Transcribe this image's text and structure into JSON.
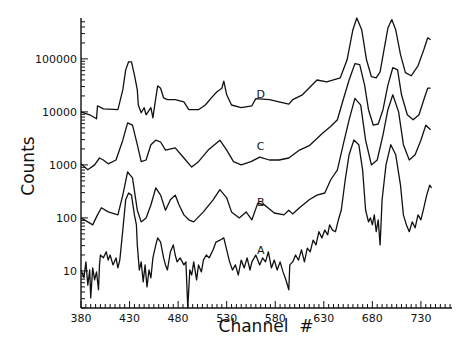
{
  "chart_data": {
    "type": "line",
    "title": "",
    "xlabel": "Channel  #",
    "ylabel": "Counts",
    "xscale": "linear",
    "yscale": "log",
    "xlim": [
      380,
      762
    ],
    "ylim": [
      2,
      590000
    ],
    "grid": false,
    "legend": "none",
    "x_ticks": [
      380,
      430,
      480,
      530,
      580,
      630,
      680,
      730
    ],
    "x_tick_labels": [
      "380",
      "430",
      "480",
      "530",
      "580",
      "630",
      "680",
      "730"
    ],
    "y_ticks": [
      10,
      100,
      1000,
      10000,
      100000
    ],
    "y_tick_labels": [
      "10",
      "100",
      "1000",
      "10000",
      "100000"
    ],
    "series": [
      {
        "name": "D",
        "label_at": {
          "x": 565,
          "y": 14000
        },
        "points": [
          [
            380,
            10000
          ],
          [
            389,
            8800
          ],
          [
            396,
            7400
          ],
          [
            397,
            13000
          ],
          [
            403,
            11400
          ],
          [
            418,
            11000
          ],
          [
            423,
            26000
          ],
          [
            426,
            62000
          ],
          [
            429,
            88000
          ],
          [
            432,
            88000
          ],
          [
            435,
            50000
          ],
          [
            438,
            26000
          ],
          [
            439,
            13500
          ],
          [
            442,
            9600
          ],
          [
            445,
            12000
          ],
          [
            447,
            8800
          ],
          [
            452,
            12000
          ],
          [
            454,
            7700
          ],
          [
            457,
            18400
          ],
          [
            459,
            31000
          ],
          [
            462,
            28000
          ],
          [
            465,
            18400
          ],
          [
            469,
            17000
          ],
          [
            477,
            17000
          ],
          [
            486,
            15500
          ],
          [
            491,
            11000
          ],
          [
            501,
            11000
          ],
          [
            508,
            13500
          ],
          [
            516,
            20000
          ],
          [
            520,
            24000
          ],
          [
            525,
            28000
          ],
          [
            527,
            38000
          ],
          [
            530,
            21000
          ],
          [
            535,
            13500
          ],
          [
            545,
            12000
          ],
          [
            556,
            13000
          ],
          [
            560,
            17800
          ],
          [
            574,
            17000
          ],
          [
            594,
            14000
          ],
          [
            598,
            17000
          ],
          [
            608,
            21000
          ],
          [
            623,
            40000
          ],
          [
            633,
            37000
          ],
          [
            647,
            44000
          ],
          [
            654,
            96000
          ],
          [
            660,
            355000
          ],
          [
            664,
            590000
          ],
          [
            669,
            355000
          ],
          [
            674,
            96000
          ],
          [
            679,
            46000
          ],
          [
            684,
            44000
          ],
          [
            688,
            57000
          ],
          [
            692,
            148000
          ],
          [
            696,
            380000
          ],
          [
            700,
            550000
          ],
          [
            704,
            355000
          ],
          [
            709,
            120000
          ],
          [
            714,
            55000
          ],
          [
            720,
            48000
          ],
          [
            727,
            74000
          ],
          [
            733,
            148000
          ],
          [
            737,
            250000
          ],
          [
            740,
            230000
          ]
        ]
      },
      {
        "name": "C",
        "label_at": {
          "x": 565,
          "y": 1500
        },
        "points": [
          [
            380,
            1050
          ],
          [
            387,
            810
          ],
          [
            394,
            1000
          ],
          [
            399,
            1350
          ],
          [
            403,
            1240
          ],
          [
            408,
            1050
          ],
          [
            416,
            1240
          ],
          [
            423,
            2930
          ],
          [
            428,
            6200
          ],
          [
            433,
            5600
          ],
          [
            438,
            2400
          ],
          [
            442,
            1150
          ],
          [
            447,
            1240
          ],
          [
            452,
            2400
          ],
          [
            457,
            2930
          ],
          [
            462,
            2700
          ],
          [
            467,
            1900
          ],
          [
            477,
            2100
          ],
          [
            486,
            1350
          ],
          [
            494,
            910
          ],
          [
            501,
            1150
          ],
          [
            511,
            1900
          ],
          [
            523,
            2930
          ],
          [
            530,
            1900
          ],
          [
            537,
            1150
          ],
          [
            545,
            1000
          ],
          [
            555,
            1150
          ],
          [
            564,
            1400
          ],
          [
            574,
            1240
          ],
          [
            584,
            1240
          ],
          [
            594,
            1350
          ],
          [
            605,
            1900
          ],
          [
            615,
            2300
          ],
          [
            621,
            2930
          ],
          [
            629,
            4000
          ],
          [
            637,
            5300
          ],
          [
            644,
            7100
          ],
          [
            650,
            17000
          ],
          [
            656,
            40000
          ],
          [
            662,
            81000
          ],
          [
            667,
            78000
          ],
          [
            672,
            32000
          ],
          [
            676,
            11000
          ],
          [
            681,
            5600
          ],
          [
            686,
            5900
          ],
          [
            691,
            11000
          ],
          [
            696,
            32000
          ],
          [
            701,
            68000
          ],
          [
            706,
            62000
          ],
          [
            710,
            21000
          ],
          [
            716,
            8800
          ],
          [
            722,
            7100
          ],
          [
            728,
            8800
          ],
          [
            733,
            17000
          ],
          [
            737,
            28000
          ],
          [
            740,
            28000
          ]
        ]
      },
      {
        "name": "B",
        "label_at": {
          "x": 565,
          "y": 130
        },
        "points": [
          [
            380,
            100
          ],
          [
            387,
            84
          ],
          [
            392,
            74
          ],
          [
            397,
            114
          ],
          [
            401,
            155
          ],
          [
            408,
            130
          ],
          [
            418,
            114
          ],
          [
            423,
            270
          ],
          [
            428,
            740
          ],
          [
            433,
            570
          ],
          [
            438,
            140
          ],
          [
            442,
            84
          ],
          [
            447,
            100
          ],
          [
            452,
            175
          ],
          [
            457,
            370
          ],
          [
            462,
            270
          ],
          [
            467,
            140
          ],
          [
            472,
            220
          ],
          [
            477,
            270
          ],
          [
            481,
            175
          ],
          [
            486,
            114
          ],
          [
            491,
            92
          ],
          [
            496,
            84
          ],
          [
            506,
            130
          ],
          [
            516,
            220
          ],
          [
            523,
            340
          ],
          [
            530,
            240
          ],
          [
            535,
            130
          ],
          [
            543,
            100
          ],
          [
            550,
            130
          ],
          [
            556,
            92
          ],
          [
            562,
            190
          ],
          [
            569,
            175
          ],
          [
            579,
            124
          ],
          [
            589,
            114
          ],
          [
            594,
            140
          ],
          [
            598,
            119
          ],
          [
            605,
            155
          ],
          [
            615,
            220
          ],
          [
            623,
            270
          ],
          [
            631,
            295
          ],
          [
            637,
            520
          ],
          [
            644,
            810
          ],
          [
            650,
            2400
          ],
          [
            656,
            7100
          ],
          [
            662,
            18000
          ],
          [
            668,
            13400
          ],
          [
            673,
            2930
          ],
          [
            679,
            1000
          ],
          [
            685,
            1240
          ],
          [
            691,
            3700
          ],
          [
            696,
            11000
          ],
          [
            701,
            21000
          ],
          [
            707,
            10000
          ],
          [
            712,
            2400
          ],
          [
            718,
            1240
          ],
          [
            724,
            1550
          ],
          [
            730,
            2930
          ],
          [
            735,
            5600
          ],
          [
            740,
            4600
          ]
        ]
      },
      {
        "name": "A",
        "label_at": {
          "x": 565,
          "y": 16
        },
        "points": [
          [
            380,
            10.4
          ],
          [
            383,
            7.4
          ],
          [
            385,
            14.8
          ],
          [
            387,
            5.4
          ],
          [
            389,
            10.4
          ],
          [
            390,
            3.1
          ],
          [
            392,
            11.4
          ],
          [
            394,
            6.8
          ],
          [
            396,
            9.6
          ],
          [
            398,
            4.4
          ],
          [
            399,
            13
          ],
          [
            400,
            20
          ],
          [
            403,
            17.6
          ],
          [
            406,
            23
          ],
          [
            408,
            16
          ],
          [
            410,
            20
          ],
          [
            413,
            13
          ],
          [
            416,
            17.6
          ],
          [
            418,
            11.4
          ],
          [
            420,
            16
          ],
          [
            423,
            59
          ],
          [
            426,
            220
          ],
          [
            429,
            295
          ],
          [
            432,
            270
          ],
          [
            435,
            114
          ],
          [
            437,
            74
          ],
          [
            438,
            31
          ],
          [
            440,
            10.4
          ],
          [
            442,
            14.8
          ],
          [
            444,
            6.2
          ],
          [
            446,
            13
          ],
          [
            448,
            5.0
          ],
          [
            450,
            10.4
          ],
          [
            452,
            7.4
          ],
          [
            454,
            17.6
          ],
          [
            457,
            31
          ],
          [
            459,
            42
          ],
          [
            462,
            35
          ],
          [
            465,
            17.6
          ],
          [
            467,
            13
          ],
          [
            469,
            10.4
          ],
          [
            472,
            23
          ],
          [
            475,
            31
          ],
          [
            477,
            20
          ],
          [
            479,
            14.8
          ],
          [
            482,
            17.6
          ],
          [
            486,
            13
          ],
          [
            488,
            14.8
          ],
          [
            490,
            2.0
          ],
          [
            492,
            10.4
          ],
          [
            494,
            8.4
          ],
          [
            496,
            14.8
          ],
          [
            499,
            6.8
          ],
          [
            501,
            13
          ],
          [
            504,
            9.6
          ],
          [
            506,
            16
          ],
          [
            509,
            20
          ],
          [
            512,
            17.6
          ],
          [
            516,
            25
          ],
          [
            519,
            35
          ],
          [
            523,
            38
          ],
          [
            527,
            42
          ],
          [
            530,
            25
          ],
          [
            533,
            14.8
          ],
          [
            536,
            10.4
          ],
          [
            539,
            13
          ],
          [
            542,
            8.4
          ],
          [
            545,
            16
          ],
          [
            548,
            11.4
          ],
          [
            551,
            17.6
          ],
          [
            554,
            10.4
          ],
          [
            556,
            14.8
          ],
          [
            560,
            20
          ],
          [
            564,
            13
          ],
          [
            567,
            17.6
          ],
          [
            570,
            14.8
          ],
          [
            573,
            23
          ],
          [
            576,
            11.4
          ],
          [
            579,
            16
          ],
          [
            582,
            10.4
          ],
          [
            585,
            14.8
          ],
          [
            588,
            9.6
          ],
          [
            591,
            6.8
          ],
          [
            594,
            4.4
          ],
          [
            595,
            13
          ],
          [
            598,
            14.8
          ],
          [
            601,
            20
          ],
          [
            604,
            16
          ],
          [
            607,
            25
          ],
          [
            610,
            14.8
          ],
          [
            613,
            27
          ],
          [
            616,
            23
          ],
          [
            619,
            38
          ],
          [
            622,
            31
          ],
          [
            625,
            55
          ],
          [
            628,
            42
          ],
          [
            631,
            59
          ],
          [
            634,
            48
          ],
          [
            636,
            74
          ],
          [
            639,
            59
          ],
          [
            642,
            55
          ],
          [
            645,
            92
          ],
          [
            648,
            141
          ],
          [
            652,
            520
          ],
          [
            656,
            1560
          ],
          [
            661,
            2950
          ],
          [
            666,
            2400
          ],
          [
            670,
            810
          ],
          [
            673,
            141
          ],
          [
            676,
            84
          ],
          [
            678,
            100
          ],
          [
            680,
            74
          ],
          [
            682,
            114
          ],
          [
            684,
            55
          ],
          [
            686,
            92
          ],
          [
            688,
            31
          ],
          [
            690,
            220
          ],
          [
            694,
            1000
          ],
          [
            699,
            2400
          ],
          [
            704,
            1560
          ],
          [
            709,
            415
          ],
          [
            712,
            114
          ],
          [
            715,
            74
          ],
          [
            718,
            55
          ],
          [
            721,
            84
          ],
          [
            724,
            65
          ],
          [
            727,
            114
          ],
          [
            730,
            92
          ],
          [
            733,
            155
          ],
          [
            736,
            270
          ],
          [
            739,
            415
          ],
          [
            741,
            370
          ]
        ]
      }
    ]
  }
}
